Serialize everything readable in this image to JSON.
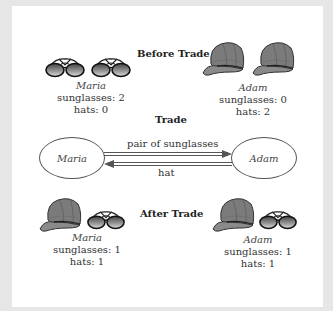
{
  "headings": {
    "before": "Before Trade",
    "trade": "Trade",
    "after": "After Trade"
  },
  "before": {
    "maria": {
      "name": "Maria",
      "sunglasses": "sunglasses: 2",
      "hats": "hats: 0",
      "items": [
        "sunglasses-icon",
        "sunglasses-icon"
      ]
    },
    "adam": {
      "name": "Adam",
      "sunglasses": "sunglasses: 0",
      "hats": "hats: 2",
      "items": [
        "cap-icon",
        "cap-icon"
      ]
    }
  },
  "trade": {
    "left_party": "Maria",
    "right_party": "Adam",
    "to_right_label": "pair of sunglasses",
    "to_left_label": "hat"
  },
  "after": {
    "maria": {
      "name": "Maria",
      "sunglasses": "sunglasses: 1",
      "hats": "hats: 1",
      "items": [
        "cap-icon",
        "sunglasses-icon"
      ]
    },
    "adam": {
      "name": "Adam",
      "sunglasses": "sunglasses: 1",
      "hats": "hats: 1",
      "items": [
        "cap-icon",
        "sunglasses-icon"
      ]
    }
  },
  "colors": {
    "cap": "#7a7a7a",
    "lens": "#8a8a8a",
    "outline": "#222222",
    "arrow": "#555555"
  }
}
